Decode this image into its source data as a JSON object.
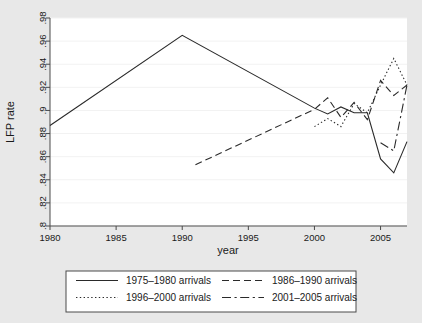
{
  "chart_data": {
    "type": "line",
    "title": "",
    "xlabel": "year",
    "ylabel": "LFP rate",
    "xlim": [
      1980,
      2007
    ],
    "ylim": [
      0.8,
      0.98
    ],
    "grid": true,
    "legend_position": "bottom",
    "xticks": [
      1980,
      1985,
      1990,
      1995,
      2000,
      2005
    ],
    "xticklabels": [
      "1980",
      "1985",
      "1990",
      "1995",
      "2000",
      "2005"
    ],
    "yticks": [
      0.8,
      0.82,
      0.84,
      0.86,
      0.88,
      0.9,
      0.92,
      0.94,
      0.96,
      0.98
    ],
    "yticklabels": [
      ".8",
      ".82",
      ".84",
      ".86",
      ".88",
      ".9",
      ".92",
      ".94",
      ".96",
      ".98"
    ],
    "series": [
      {
        "name": "1975–1980 arrivals",
        "style": "solid",
        "x": [
          1980,
          1990,
          2000,
          2001,
          2002,
          2003,
          2004,
          2005,
          2006,
          2007
        ],
        "values": [
          0.887,
          0.965,
          0.902,
          0.897,
          0.903,
          0.898,
          0.898,
          0.858,
          0.846,
          0.873
        ]
      },
      {
        "name": "1986–1990 arrivals",
        "style": "dashed",
        "x": [
          1991,
          2000,
          2001,
          2002,
          2003,
          2004,
          2005,
          2006,
          2007
        ],
        "values": [
          0.853,
          0.901,
          0.911,
          0.894,
          0.907,
          0.892,
          0.926,
          0.913,
          0.922
        ]
      },
      {
        "name": "1996–2000 arrivals",
        "style": "dotted",
        "x": [
          2000,
          2001,
          2002,
          2003,
          2004,
          2005,
          2006,
          2007
        ],
        "values": [
          0.886,
          0.893,
          0.886,
          0.906,
          0.898,
          0.922,
          0.945,
          0.922
        ]
      },
      {
        "name": "2001–2005 arrivals",
        "style": "dashdot",
        "x": [
          2005,
          2006,
          2007
        ],
        "values": [
          0.872,
          0.865,
          0.922
        ]
      }
    ]
  },
  "axes": {
    "y_title": "LFP rate",
    "x_title": "year"
  },
  "legend": {
    "entries": [
      {
        "label": "1975–1980 arrivals",
        "style": "solid"
      },
      {
        "label": "1986–1990 arrivals",
        "style": "dashed"
      },
      {
        "label": "1996–2000 arrivals",
        "style": "dotted"
      },
      {
        "label": "2001–2005 arrivals",
        "style": "dashdot"
      }
    ]
  },
  "colors": {
    "line": "#2a2a2a",
    "background": "#e8e8e8",
    "plot_background": "#ffffff",
    "grid": "#f2f2f2",
    "axis": "#4a4a4a"
  }
}
